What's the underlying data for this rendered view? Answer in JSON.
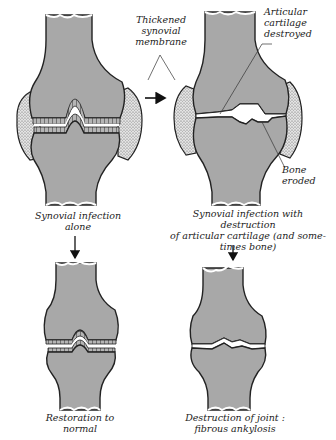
{
  "figure": {
    "type": "medical-diagram",
    "colors": {
      "bone_fill": "#a8a8a8",
      "outline": "#222222",
      "synovium_fill": "#d8d8d8",
      "joint_space": "#ffffff",
      "background": "#ffffff"
    }
  },
  "panels": {
    "top_left": {
      "label": "Synovial infection\nalone",
      "stage": "synovial infection"
    },
    "top_right": {
      "label": "Synovial infection with destruction\nof articular cartilage (and some-\ntimes bone)",
      "stage": "cartilage destruction"
    },
    "bottom_left": {
      "label": "Restoration to\nnormal",
      "stage": "recovery"
    },
    "bottom_right": {
      "label": "Destruction of joint :\nfibrous ankylosis",
      "stage": "ankylosis"
    }
  },
  "annotations": {
    "thickened_synovium": "Thickened\nsynovial\nmembrane",
    "cartilage_destroyed": "Articular\ncartilage\ndestroyed",
    "bone_eroded": "Bone\neroded"
  },
  "arrows": [
    {
      "from": "top_left",
      "to": "top_right",
      "direction": "right"
    },
    {
      "from": "top_left",
      "to": "bottom_left",
      "direction": "down"
    },
    {
      "from": "top_right",
      "to": "bottom_right",
      "direction": "down"
    }
  ]
}
